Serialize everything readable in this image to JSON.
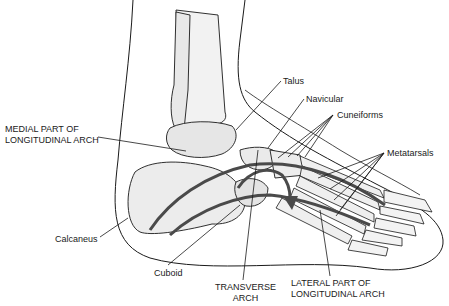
{
  "figure": {
    "labels": [
      {
        "id": "talus",
        "lines": [
          "Talus"
        ],
        "x": 283,
        "y": 76,
        "align": "left",
        "leader": [
          [
            281,
            81
          ],
          [
            236,
            130
          ]
        ]
      },
      {
        "id": "navicular",
        "lines": [
          "Navicular"
        ],
        "x": 306,
        "y": 94,
        "align": "left",
        "leader": [
          [
            304,
            99
          ],
          [
            268,
            148
          ]
        ]
      },
      {
        "id": "cuneiforms",
        "lines": [
          "Cuneiforms"
        ],
        "x": 337,
        "y": 110,
        "align": "left",
        "leader_fan_origin": [
          333,
          115
        ],
        "leader_fan_targets": [
          [
            278,
            158
          ],
          [
            288,
            157
          ],
          [
            297,
            156
          ],
          [
            305,
            157
          ]
        ]
      },
      {
        "id": "metatarsals",
        "lines": [
          "Metatarsals"
        ],
        "x": 387,
        "y": 148,
        "align": "left",
        "leader_fan_origin": [
          384,
          153
        ],
        "leader_fan_targets": [
          [
            318,
            178
          ],
          [
            330,
            189
          ],
          [
            334,
            200
          ],
          [
            340,
            210
          ],
          [
            336,
            216
          ]
        ]
      },
      {
        "id": "medial-arch",
        "lines": [
          "MEDIAL PART OF",
          "LONGITUDINAL ARCH"
        ],
        "x": 5,
        "y": 124,
        "align": "left",
        "leader": [
          [
            98,
            137
          ],
          [
            186,
            151
          ]
        ]
      },
      {
        "id": "calcaneus",
        "lines": [
          "Calcaneus"
        ],
        "x": 55,
        "y": 234,
        "align": "left",
        "leader": [
          [
            100,
            237
          ],
          [
            128,
            218
          ]
        ]
      },
      {
        "id": "cuboid",
        "lines": [
          "Cuboid"
        ],
        "x": 154,
        "y": 268,
        "align": "left",
        "leader": [
          [
            168,
            265
          ],
          [
            240,
            205
          ]
        ]
      },
      {
        "id": "transverse-arch",
        "lines": [
          "TRANSVERSE",
          "ARCH"
        ],
        "x": 215,
        "y": 282,
        "align": "center",
        "leader": [
          [
            243,
            280
          ],
          [
            258,
            150
          ]
        ]
      },
      {
        "id": "lateral-arch",
        "lines": [
          "LATERAL PART OF",
          "LONGITUDINAL ARCH"
        ],
        "x": 291,
        "y": 278,
        "align": "left",
        "leader": [
          [
            330,
            276
          ],
          [
            320,
            210
          ]
        ]
      }
    ],
    "colors": {
      "outline": "#1a1a1a",
      "bone_fill": "#eeeeee",
      "bone_shade": "#9a9a9a",
      "arch_band": "#4a4a4a",
      "background": "#ffffff"
    }
  }
}
